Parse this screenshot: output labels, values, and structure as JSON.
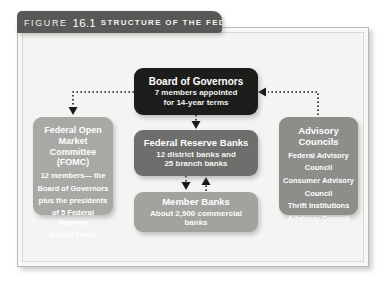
{
  "header": {
    "figure_word": "FIGURE",
    "figure_number": "16.1",
    "title": "STRUCTURE OF THE FED"
  },
  "boxes": {
    "board_of_governors": {
      "title": "Board of Governors",
      "line1": "7 members appointed",
      "line2": "for 14-year terms"
    },
    "federal_reserve_banks": {
      "title": "Federal Reserve Banks",
      "line1": "12 district banks and",
      "line2": "25 branch banks"
    },
    "member_banks": {
      "title": "Member Banks",
      "line1": "About 2,900 commercial banks"
    },
    "fomc": {
      "title_line1": "Federal Open",
      "title_line2": "Market",
      "title_line3": "Committee (FOMC)",
      "body_line1": "12 members— the",
      "body_line2": "Board of Governors",
      "body_line3": "plus the presidents",
      "body_line4": "of 5 Federal Reserve",
      "body_line5": "district banks"
    },
    "advisory_councils": {
      "title_line1": "Advisory",
      "title_line2": "Councils",
      "body_line1": "Federal Advisory",
      "body_line2": "Council",
      "body_line3": "Consumer Advisory",
      "body_line4": "Council",
      "body_line5": "Thrift Institutions",
      "body_line6": "Advisory Council"
    }
  },
  "colors": {
    "header_tab": "#585856",
    "panel_background": "#f4f4f2",
    "board_of_governors": "#1d1d1b",
    "federal_reserve_banks": "#6e6e6c",
    "member_banks": "#a2a29f",
    "fomc": "#a8a8a5",
    "advisory_councils": "#8d8d8a",
    "connector": "#1a1a18"
  },
  "connectors": [
    {
      "name": "board-to-fomc",
      "from": "board_of_governors",
      "to": "fomc",
      "style": "dotted",
      "direction": "down-left"
    },
    {
      "name": "advisory-to-board",
      "from": "advisory_councils",
      "to": "board_of_governors",
      "style": "dotted",
      "direction": "up-left"
    },
    {
      "name": "board-to-reserve-banks",
      "from": "board_of_governors",
      "to": "federal_reserve_banks",
      "style": "dotted",
      "direction": "down"
    },
    {
      "name": "reserve-banks-to-member-banks",
      "from": "federal_reserve_banks",
      "to": "member_banks",
      "style": "dotted",
      "direction": "down"
    },
    {
      "name": "member-banks-to-reserve-banks",
      "from": "member_banks",
      "to": "federal_reserve_banks",
      "style": "dotted",
      "direction": "up"
    }
  ]
}
